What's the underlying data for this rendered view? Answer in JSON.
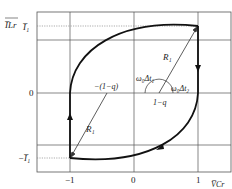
{
  "diagram": {
    "type": "state-plane trajectory",
    "y_axis_label": "I_Lr (normalized)",
    "x_axis_label": "V_Cr (normalized)",
    "y_ticks": [
      {
        "label": "I̅₁",
        "value": "I1"
      },
      {
        "label": "0",
        "value": 0
      },
      {
        "label": "−I̅₁",
        "value": "-I1"
      }
    ],
    "x_ticks": [
      {
        "label": "−1",
        "value": -1
      },
      {
        "label": "0",
        "value": 0
      },
      {
        "label": "1",
        "value": 1
      }
    ],
    "annotations": {
      "radius_upper": "R₁",
      "radius_lower": "R₁",
      "center_upper": "1−q",
      "center_lower": "−(1−q)",
      "angle_1": "ω₀Δt₁",
      "angle_2": "ω₀Δt₂"
    },
    "axis_titles": {
      "y": "I̅Lr",
      "y_sub": "Lr",
      "x": "V̅Cr",
      "x_sub": "Cr"
    },
    "colors": {
      "trajectory": "#111111",
      "grid": "#555555",
      "dotted": "#777777",
      "radius": "#333333"
    }
  }
}
